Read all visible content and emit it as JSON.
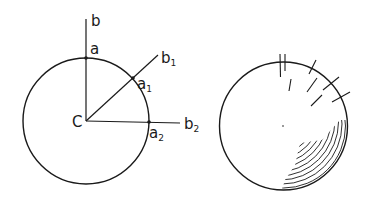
{
  "figure": {
    "left_diagram": {
      "center_label": "C",
      "points": [
        {
          "label": "a",
          "sub": ""
        },
        {
          "label": "a",
          "sub": "1"
        },
        {
          "label": "a",
          "sub": "2"
        }
      ],
      "rays": [
        {
          "label": "b",
          "sub": ""
        },
        {
          "label": "b",
          "sub": "1"
        },
        {
          "label": "b",
          "sub": "2"
        }
      ]
    },
    "right_diagram": {
      "description": "sphere with tangent and interior stroke marks, shaded lower-right"
    },
    "colors": {
      "ink": "#1a1a1a",
      "background": "#ffffff"
    }
  }
}
